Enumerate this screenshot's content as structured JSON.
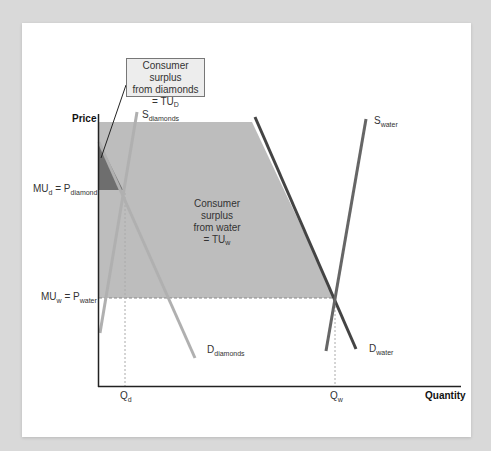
{
  "diagram": {
    "axes": {
      "y_title": "Price",
      "x_title": "Quantity"
    },
    "price_labels": {
      "diamond": {
        "main": "MU",
        "main_sub": "d",
        "eq": " = P",
        "eq_sub": "diamond"
      },
      "water": {
        "main": "MU",
        "main_sub": "w",
        "eq": " = P",
        "eq_sub": "water"
      }
    },
    "quantity_labels": {
      "diamond": {
        "main": "Q",
        "sub": "d"
      },
      "water": {
        "main": "Q",
        "sub": "w"
      }
    },
    "curves": {
      "s_diamonds": {
        "main": "S",
        "sub": "diamonds"
      },
      "d_diamonds": {
        "main": "D",
        "sub": "diamonds"
      },
      "s_water": {
        "main": "S",
        "sub": "water"
      },
      "d_water": {
        "main": "D",
        "sub": "water"
      }
    },
    "callout_diamonds": {
      "line1": "Consumer surplus",
      "line2": "from diamonds",
      "line3": "= TU",
      "line3_sub": "D"
    },
    "water_surplus": {
      "line1": "Consumer",
      "line2": "surplus",
      "line3": "from water",
      "line4": "= TU",
      "line4_sub": "w"
    },
    "colors": {
      "background": "#d9d9d9",
      "card": "#ffffff",
      "water_surplus_fill": "#bdbdbd",
      "diamond_surplus_fill": "#6e6e6e",
      "diamond_curves": "#b0b0b0",
      "water_curves": "#555555",
      "axis": "#222222"
    }
  }
}
